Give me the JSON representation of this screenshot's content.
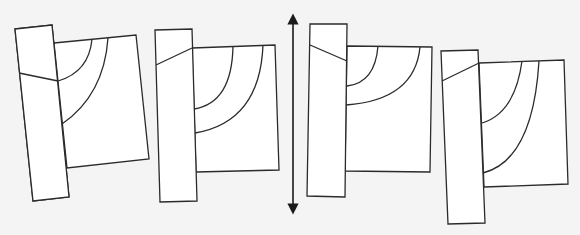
{
  "diagram": {
    "background": "#f4f4f4",
    "stroke_color": "#2b2b2b",
    "fill_color": "#ffffff",
    "figures": [
      {
        "id": "figure-1",
        "tall_rect": [
          [
            15,
            29
          ],
          [
            52,
            25
          ],
          [
            69,
            197
          ],
          [
            33,
            201
          ]
        ],
        "square": [
          [
            54,
            43
          ],
          [
            136,
            35
          ],
          [
            149,
            159
          ],
          [
            67,
            168
          ]
        ],
        "divider": [
          [
            19,
            73
          ],
          [
            58,
            81
          ]
        ],
        "arc_inner": {
          "from": [
            92,
            39
          ],
          "ctrl": [
            89,
            72
          ],
          "to": [
            58,
            81
          ]
        },
        "arc_outer": {
          "from": [
            108,
            38
          ],
          "ctrl": [
            104,
            95
          ],
          "to": [
            62,
            124
          ]
        }
      },
      {
        "id": "figure-2",
        "tall_rect": [
          [
            155,
            30
          ],
          [
            192,
            29
          ],
          [
            197,
            201
          ],
          [
            160,
            202
          ]
        ],
        "square": [
          [
            192,
            48
          ],
          [
            275,
            45
          ],
          [
            279,
            170
          ],
          [
            196,
            172
          ]
        ],
        "divider": [
          [
            156,
            65
          ],
          [
            192,
            48
          ]
        ],
        "arc_inner": {
          "from": [
            233,
            46
          ],
          "ctrl": [
            232,
            103
          ],
          "to": [
            194,
            109
          ]
        },
        "arc_outer": {
          "from": [
            263,
            45
          ],
          "ctrl": [
            260,
            122
          ],
          "to": [
            195,
            133
          ]
        }
      },
      {
        "id": "figure-3",
        "tall_rect": [
          [
            310,
            24
          ],
          [
            347,
            24
          ],
          [
            345,
            197
          ],
          [
            307,
            196
          ]
        ],
        "square": [
          [
            347,
            46
          ],
          [
            432,
            47
          ],
          [
            430,
            172
          ],
          [
            345,
            171
          ]
        ],
        "divider": [
          [
            310,
            45
          ],
          [
            347,
            61
          ]
        ],
        "arc_inner": {
          "from": [
            378,
            46
          ],
          "ctrl": [
            375,
            83
          ],
          "to": [
            347,
            86
          ]
        },
        "arc_outer": {
          "from": [
            420,
            47
          ],
          "ctrl": [
            415,
            100
          ],
          "to": [
            346,
            105
          ]
        }
      },
      {
        "id": "figure-4",
        "tall_rect": [
          [
            441,
            51
          ],
          [
            478,
            50
          ],
          [
            485,
            223
          ],
          [
            448,
            224
          ]
        ],
        "square": [
          [
            479,
            63
          ],
          [
            564,
            60
          ],
          [
            568,
            184
          ],
          [
            484,
            187
          ]
        ],
        "divider": [
          [
            442,
            81
          ],
          [
            479,
            63
          ]
        ],
        "arc_inner": {
          "from": [
            522,
            61
          ],
          "ctrl": [
            515,
            113
          ],
          "to": [
            482,
            123
          ]
        },
        "arc_outer": {
          "from": [
            539,
            61
          ],
          "ctrl": [
            533,
            160
          ],
          "to": [
            483,
            173
          ]
        }
      }
    ],
    "arrow": {
      "type": "double-headed-vertical",
      "x": 293,
      "y_top": 13,
      "y_bottom": 215
    }
  }
}
